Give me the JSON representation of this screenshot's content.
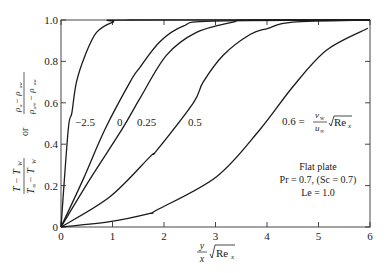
{
  "chart_data": {
    "type": "line",
    "title": "",
    "xlabel": "(y/x) √Re_x",
    "ylabel": "(T − T_W)/(T_∞ − T_W)  or  (ρ_a − ρ_aw)/(ρ_a∞ − ρ_aw)",
    "ylabel_parts": {
      "temp_num": "T − T",
      "temp_num_sub": "W",
      "temp_den": "T",
      "temp_den_sub1": "∞",
      "temp_den_mid": " − T",
      "temp_den_sub2": "W",
      "or": "or",
      "conc_num": "ρ",
      "conc_num_sub1": "a",
      "conc_num_mid": " − ρ",
      "conc_num_sub2": "aw",
      "conc_den": "ρ",
      "conc_den_sub1": "a∞",
      "conc_den_mid": " − ρ",
      "conc_den_sub2": "aw"
    },
    "xlabel_parts": {
      "frac_num": "y",
      "frac_den": "x",
      "root": "Re",
      "sub": "x"
    },
    "xlim": [
      0,
      6
    ],
    "ylim": [
      0,
      1.0
    ],
    "x_ticks": [
      "0",
      "1",
      "2",
      "3",
      "4",
      "5",
      "6"
    ],
    "y_ticks": [
      "0",
      "0.2",
      "0.4",
      "0.6",
      "0.8",
      "1.0"
    ],
    "grid": false,
    "legend": "none (curves labeled inline)",
    "series": [
      {
        "name": "-2.5",
        "label": "−2.5",
        "x": [
          0,
          0.14,
          0.21,
          0.3,
          0.47,
          0.69,
          1.01,
          1.34,
          6
        ],
        "y": [
          0,
          0.47,
          0.55,
          0.7,
          0.83,
          0.94,
          0.99,
          1.0,
          1.0
        ]
      },
      {
        "name": "0",
        "label": "0",
        "x": [
          0,
          0.43,
          0.85,
          1.34,
          1.53,
          1.92,
          2.37,
          2.95,
          6
        ],
        "y": [
          0,
          0.23,
          0.47,
          0.7,
          0.77,
          0.895,
          0.97,
          0.995,
          1.0
        ]
      },
      {
        "name": "0.25",
        "label": "0.25",
        "x": [
          0,
          0.56,
          1.18,
          1.53,
          2.05,
          2.63,
          3.34,
          3.67,
          6
        ],
        "y": [
          0,
          0.23,
          0.47,
          0.62,
          0.83,
          0.94,
          0.99,
          1.0,
          1.0
        ]
      },
      {
        "name": "0.5",
        "label": "0.5",
        "x": [
          0,
          0.95,
          1.73,
          1.86,
          2.57,
          2.76,
          3.15,
          3.67,
          4.02,
          4.5,
          6
        ],
        "y": [
          0,
          0.146,
          0.34,
          0.37,
          0.6,
          0.7,
          0.83,
          0.93,
          0.96,
          0.99,
          1.0
        ]
      },
      {
        "name": "0.6",
        "label": "0.6 = (v_w/u_∞) √Re_x",
        "x": [
          0,
          0.95,
          1.73,
          1.86,
          3.02,
          3.86,
          4.51,
          5.16,
          5.96
        ],
        "y": [
          0,
          0.026,
          0.066,
          0.082,
          0.243,
          0.47,
          0.68,
          0.855,
          0.96
        ]
      }
    ],
    "annotations": [
      "Flat plate",
      "Pr = 0.7, (Sc = 0.7)",
      "Le = 1.0"
    ]
  },
  "labels": {
    "curve_m25": "−2.5",
    "curve_0": "0",
    "curve_025": "0.25",
    "curve_05": "0.5",
    "curve_06_prefix": "0.6 =",
    "curve_06_num": "v",
    "curve_06_num_sub": "w",
    "curve_06_den": "u",
    "curve_06_den_sub": "∞",
    "curve_06_root": "Re",
    "curve_06_root_sub": "x",
    "note_line1": "Flat plate",
    "note_line2": "Pr = 0.7,  (Sc = 0.7)",
    "note_line3": "Le = 1.0"
  }
}
